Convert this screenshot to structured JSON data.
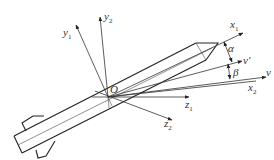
{
  "diagram": {
    "origin_label": "O",
    "axes": [
      {
        "id": "y1",
        "base": "y",
        "sub": "1"
      },
      {
        "id": "y2",
        "base": "y",
        "sub": "2"
      },
      {
        "id": "x1",
        "base": "x",
        "sub": "1"
      },
      {
        "id": "v_prime",
        "base": "v'",
        "sub": ""
      },
      {
        "id": "v",
        "base": "v",
        "sub": ""
      },
      {
        "id": "x2",
        "base": "x",
        "sub": "2"
      },
      {
        "id": "z1",
        "base": "z",
        "sub": "1"
      },
      {
        "id": "z2",
        "base": "z",
        "sub": "2"
      }
    ],
    "angles": [
      {
        "id": "alpha",
        "label": "α"
      },
      {
        "id": "beta",
        "label": "β"
      }
    ],
    "colors": {
      "line": "#333333",
      "background": "#ffffff"
    }
  }
}
